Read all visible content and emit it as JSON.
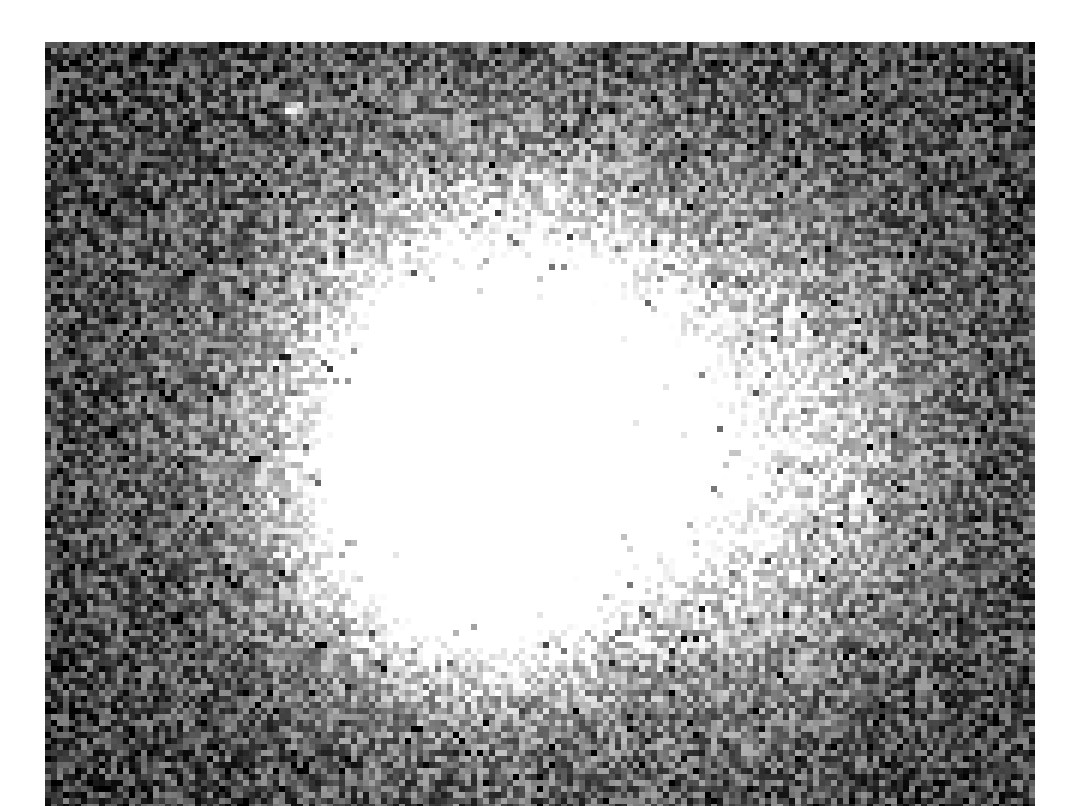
{
  "image": {
    "kind": "astronomical-grayscale-frame",
    "background_color": "#ffffff",
    "frame": {
      "x": 45,
      "y": 42,
      "width": 990,
      "height": 764
    },
    "pixel_size": 6,
    "sky_level": 60,
    "noise_amplitude": 70,
    "sources": [
      {
        "name": "central-core",
        "cx": 455,
        "cy": 368,
        "rx": 210,
        "ry": 230,
        "peak": 330
      },
      {
        "name": "core-extension",
        "cx": 420,
        "cy": 470,
        "rx": 170,
        "ry": 170,
        "peak": 260
      },
      {
        "name": "outer-halo",
        "cx": 500,
        "cy": 380,
        "rx": 470,
        "ry": 420,
        "peak": 120
      },
      {
        "name": "southeast-arm",
        "cx": 720,
        "cy": 420,
        "rx": 180,
        "ry": 240,
        "peak": 110
      },
      {
        "name": "point-star",
        "cx": 245,
        "cy": 63,
        "rx": 10,
        "ry": 10,
        "peak": 200
      }
    ]
  }
}
